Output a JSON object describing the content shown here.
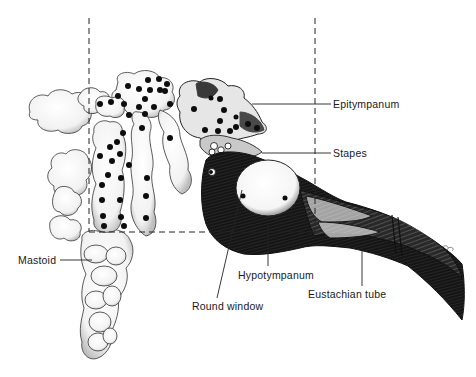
{
  "figure": {
    "colors": {
      "ink": "#111111",
      "paper": "#ffffff",
      "shade": "#2a2a2a",
      "light_cell": "#f4f4f4",
      "mid_gray": "#8a8a8a"
    },
    "signature": "H. Sasa",
    "labels": {
      "epitympanum": "Epitympanum",
      "stapes": "Stapes",
      "mastoid": "Mastoid",
      "hypotympanum": "Hypotympanum",
      "round_window": "Round window",
      "eustachian_tube": "Eustachian tube"
    },
    "reference_lines": {
      "left_vertical_x": 89,
      "right_vertical_x": 315,
      "top_y": 18,
      "bottom_horizontal_y": 232,
      "style": "dashed"
    }
  }
}
